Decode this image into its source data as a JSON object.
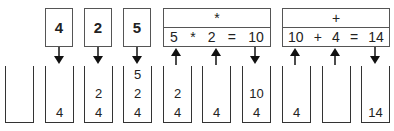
{
  "tokens": [
    "4",
    "2",
    "5"
  ],
  "operations": [
    {
      "operator": "*",
      "expression": [
        "5",
        "*",
        "2",
        "=",
        "10"
      ]
    },
    {
      "operator": "+",
      "expression": [
        "10",
        "+",
        "4",
        "=",
        "14"
      ]
    }
  ],
  "stacks": [
    [],
    [
      "4"
    ],
    [
      "4",
      "2"
    ],
    [
      "4",
      "2",
      "5"
    ],
    [
      "4",
      "2"
    ],
    [
      "4"
    ],
    [
      "4",
      "10"
    ],
    [
      "4"
    ],
    [],
    [
      "14"
    ]
  ]
}
